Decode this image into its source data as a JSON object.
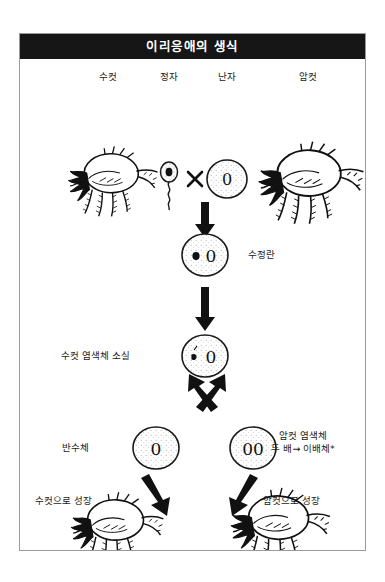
{
  "figure": {
    "title": "이리응애의 생식",
    "title_color": "#161616",
    "border_color": "#9a9a9a",
    "background": "#ffffff"
  },
  "labels": {
    "male": "수컷",
    "sperm": "정자",
    "egg": "난자",
    "female": "암컷",
    "cross_symbol": "×",
    "fertilized_egg": "수정란",
    "male_chromosome_loss": "수컷 염색체 소실",
    "haploid": "반수체",
    "female_chromosome_double_line1": "암컷 염색체",
    "female_chromosome_double_line2": "두 배→ 이배체*",
    "grows_into_male": "수컷으로 성장",
    "grows_into_female": "암컷으로 성장"
  },
  "cells": {
    "egg_chromosome": "0",
    "zygote_chromosome": "0",
    "post_loss_chromosome": "0",
    "haploid_chromosome": "0",
    "diploid_chromosome": "00"
  },
  "diagram": {
    "type": "flow-diagram",
    "nodes": [
      {
        "id": "male-mite",
        "label": "수컷",
        "kind": "mite",
        "x": 88,
        "y": 125
      },
      {
        "id": "sperm",
        "label": "정자",
        "kind": "sperm-cell",
        "x": 148,
        "y": 120
      },
      {
        "id": "egg",
        "label": "난자",
        "kind": "egg-cell",
        "content": "0",
        "x": 207,
        "y": 120
      },
      {
        "id": "female-mite",
        "label": "암컷",
        "kind": "mite",
        "x": 292,
        "y": 122
      },
      {
        "id": "zygote",
        "label": "수정란",
        "kind": "cell",
        "content": "0",
        "x": 185,
        "y": 196
      },
      {
        "id": "post-loss",
        "label": "수컷 염색체 소실",
        "kind": "cell",
        "content": "0",
        "x": 185,
        "y": 297
      },
      {
        "id": "haploid",
        "label": "반수체",
        "kind": "cell",
        "content": "0",
        "x": 136,
        "y": 389
      },
      {
        "id": "diploid",
        "label": "암컷 염색체 두 배→ 이배체*",
        "kind": "cell",
        "content": "00",
        "x": 233,
        "y": 389
      },
      {
        "id": "adult-male",
        "label": "수컷으로 성장",
        "kind": "mite",
        "x": 110,
        "y": 500
      },
      {
        "id": "adult-female",
        "label": "암컷으로 성장",
        "kind": "mite",
        "x": 272,
        "y": 500
      }
    ],
    "edges": [
      {
        "from": "sperm+egg",
        "to": "zygote",
        "style": "down-arrow"
      },
      {
        "from": "zygote",
        "to": "post-loss",
        "style": "down-arrow"
      },
      {
        "from": "post-loss",
        "to": "haploid",
        "style": "diagonal-left-arrow"
      },
      {
        "from": "post-loss",
        "to": "diploid",
        "style": "diagonal-right-arrow"
      },
      {
        "from": "haploid",
        "to": "adult-male",
        "style": "diagonal-left-arrow"
      },
      {
        "from": "diploid",
        "to": "adult-female",
        "style": "diagonal-right-arrow"
      }
    ]
  }
}
